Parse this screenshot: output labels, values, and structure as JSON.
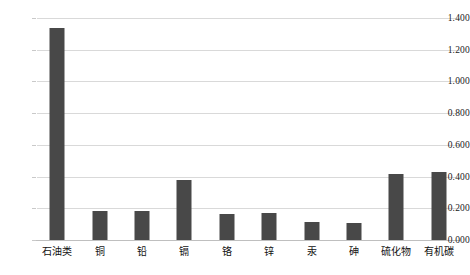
{
  "chart_data": {
    "type": "bar",
    "title": "",
    "subtitle": "",
    "xlabel": "",
    "ylabel": "",
    "categories": [
      "石油类",
      "铜",
      "铅",
      "镉",
      "铬",
      "锌",
      "汞",
      "砷",
      "硫化物",
      "有机碳"
    ],
    "values": [
      1.337,
      0.183,
      0.186,
      0.378,
      0.165,
      0.172,
      0.115,
      0.11,
      0.416,
      0.429
    ],
    "series": [
      {
        "name": "",
        "values": [
          1.337,
          0.183,
          0.186,
          0.378,
          0.165,
          0.172,
          0.115,
          0.11,
          0.416,
          0.429
        ]
      }
    ],
    "ylim": [
      0.0,
      1.4
    ],
    "ytick_values": [
      0.0,
      0.2,
      0.4,
      0.6,
      0.8,
      1.0,
      1.2,
      1.4
    ],
    "ytick_labels": [
      "0.000",
      "0.200",
      "0.400",
      "0.600",
      "0.800",
      "1.000",
      "1.200",
      "1.400"
    ],
    "grid": true,
    "grid_axis": "y",
    "legend": false,
    "legend_position": "none",
    "bar_color": "#484848",
    "grid_color": "#d9d9d9",
    "background_color": "#ffffff",
    "annotations": []
  }
}
